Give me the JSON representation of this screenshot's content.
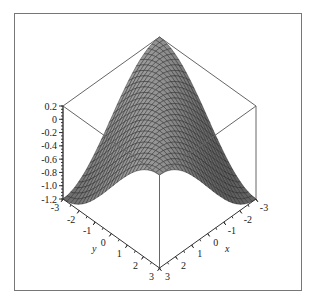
{
  "chart_data": {
    "type": "surface3d",
    "title": "",
    "function_description": "saddle-like surface: high along x=y diagonal, low at (3,-3) and (-3,3)",
    "x": {
      "label": "x",
      "ticks": [
        "-3",
        "-2",
        "-1",
        "0",
        "1",
        "2",
        "3"
      ],
      "range": [
        -3,
        3
      ]
    },
    "y": {
      "label": "y",
      "ticks": [
        "-3",
        "-2",
        "-1",
        "0",
        "1",
        "2",
        "3"
      ],
      "range": [
        -3,
        3
      ]
    },
    "z": {
      "label": "",
      "ticks": [
        "0.2",
        "0",
        "-0.2",
        "-0.4",
        "-0.6",
        "-0.8",
        "-1.0",
        "-1.2"
      ],
      "range": [
        -1.2,
        0.2
      ]
    },
    "grid_resolution": 25,
    "surface_color": "#8a8a8a",
    "mesh_color": "#222222",
    "box": true,
    "corner_values": [
      {
        "x": -3,
        "y": -3,
        "z": 0.2
      },
      {
        "x": 3,
        "y": 3,
        "z": 0.2
      },
      {
        "x": 3,
        "y": -3,
        "z": -1.2
      },
      {
        "x": -3,
        "y": 3,
        "z": -1.2
      }
    ]
  },
  "labels": {
    "x_axis": "x",
    "y_axis": "y"
  }
}
